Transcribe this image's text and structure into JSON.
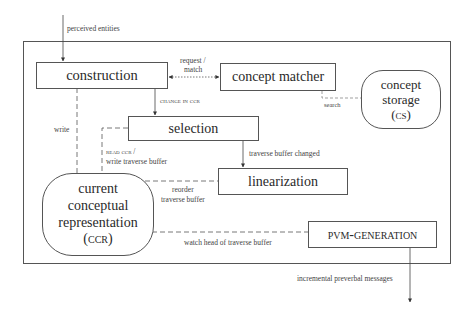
{
  "diagram": {
    "type": "architecture-flow",
    "components": {
      "construction": "construction",
      "concept_matcher": "concept matcher",
      "concept_storage": [
        "concept",
        "storage",
        "(cs)"
      ],
      "selection": "selection",
      "linearization": "linearization",
      "ccr": [
        "current",
        "conceptual",
        "representation",
        "(ccr)"
      ],
      "pvm_generation": "pvm-generation"
    },
    "edge_labels": {
      "perceived_entities": "perceived entities",
      "request_match_1": "request /",
      "request_match_2": "match",
      "change_in_ccr": "change in ccr",
      "search": "search",
      "write": "write",
      "read_ccr_1": "read ccr /",
      "read_ccr_2": "write traverse buffer",
      "traverse_buffer_changed": "traverse buffer changed",
      "reorder_1": "reorder",
      "reorder_2": "traverse buffer",
      "watch_head": "watch head of traverse buffer",
      "incremental_messages": "incremental preverbal messages"
    },
    "edges": [
      {
        "from": "input",
        "to": "construction",
        "label": "perceived entities",
        "style": "solid-arrow"
      },
      {
        "from": "construction",
        "to": "concept matcher",
        "label": "request / match",
        "style": "dotted-bidirectional"
      },
      {
        "from": "construction",
        "to": "selection",
        "label": "change in ccr",
        "style": "solid-arrow"
      },
      {
        "from": "concept matcher",
        "to": "concept storage",
        "label": "search",
        "style": "dashed"
      },
      {
        "from": "construction",
        "to": "current conceptual representation",
        "label": "write",
        "style": "dashed"
      },
      {
        "from": "selection",
        "to": "current conceptual representation",
        "label": "read ccr / write traverse buffer",
        "style": "dashed"
      },
      {
        "from": "selection",
        "to": "linearization",
        "label": "traverse buffer changed",
        "style": "solid-arrow"
      },
      {
        "from": "linearization",
        "to": "current conceptual representation",
        "label": "reorder traverse buffer",
        "style": "dashed"
      },
      {
        "from": "pvm-generation",
        "to": "current conceptual representation",
        "label": "watch head of traverse buffer",
        "style": "dashed"
      },
      {
        "from": "pvm-generation",
        "to": "output",
        "label": "incremental preverbal messages",
        "style": "solid-arrow"
      }
    ]
  }
}
